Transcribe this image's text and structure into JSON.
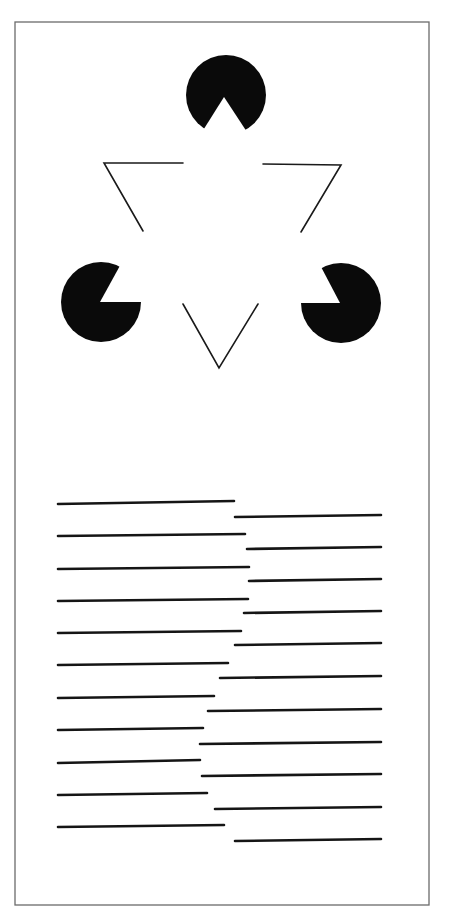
{
  "figure": {
    "title": "",
    "colors": {
      "background": "#ffffff",
      "ink": "#0a0a0a",
      "frame": "#6b6b6b"
    },
    "frame": {
      "x": 15,
      "y": 22,
      "width": 414,
      "height": 883
    },
    "kanizsa_triangle": {
      "pacmen": [
        {
          "name": "top",
          "cx": 226,
          "cy": 95,
          "r": 40,
          "notch": [
            [
              202,
              132
            ],
            [
              224,
              97
            ],
            [
              247,
              132
            ]
          ]
        },
        {
          "name": "left",
          "cx": 101,
          "cy": 302,
          "r": 40,
          "notch": [
            [
              122,
              262
            ],
            [
              100,
              302
            ],
            [
              142,
              302
            ]
          ]
        },
        {
          "name": "right",
          "cx": 341,
          "cy": 303,
          "r": 40,
          "notch": [
            [
              319,
              263
            ],
            [
              340,
              303
            ],
            [
              300,
              303
            ]
          ]
        }
      ],
      "outline_segments": [
        {
          "name": "left-corner",
          "points": [
            [
              183,
              163
            ],
            [
              104,
              163
            ],
            [
              143,
              231
            ]
          ]
        },
        {
          "name": "right-corner",
          "points": [
            [
              263,
              164
            ],
            [
              341,
              165
            ],
            [
              301,
              232
            ]
          ]
        },
        {
          "name": "bottom-corner",
          "points": [
            [
              183,
              304
            ],
            [
              219,
              368
            ],
            [
              258,
              304
            ]
          ]
        }
      ]
    },
    "illusory_contour_lines": {
      "rows": [
        {
          "left": [
            58,
            504,
            234,
            501
          ],
          "right": [
            235,
            517,
            381,
            515
          ]
        },
        {
          "left": [
            58,
            536,
            245,
            534
          ],
          "right": [
            247,
            549,
            381,
            547
          ]
        },
        {
          "left": [
            58,
            569,
            249,
            567
          ],
          "right": [
            249,
            581,
            381,
            579
          ]
        },
        {
          "left": [
            58,
            601,
            248,
            599
          ],
          "right": [
            244,
            613,
            381,
            611
          ]
        },
        {
          "left": [
            58,
            633,
            241,
            631
          ],
          "right": [
            235,
            645,
            381,
            643
          ]
        },
        {
          "left": [
            58,
            665,
            228,
            663
          ],
          "right": [
            220,
            678,
            381,
            676
          ]
        },
        {
          "left": [
            58,
            698,
            214,
            696
          ],
          "right": [
            208,
            711,
            381,
            709
          ]
        },
        {
          "left": [
            58,
            730,
            203,
            728
          ],
          "right": [
            200,
            744,
            381,
            742
          ]
        },
        {
          "left": [
            58,
            763,
            200,
            760
          ],
          "right": [
            202,
            776,
            381,
            774
          ]
        },
        {
          "left": [
            58,
            795,
            207,
            793
          ],
          "right": [
            215,
            809,
            381,
            807
          ]
        },
        {
          "left": [
            58,
            827,
            224,
            825
          ],
          "right": [
            235,
            841,
            381,
            839
          ]
        }
      ]
    }
  }
}
